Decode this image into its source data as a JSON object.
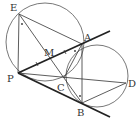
{
  "figure": {
    "type": "geometry-diagram",
    "points": [
      {
        "name": "E",
        "x": 19,
        "y": 14,
        "label_x": 10,
        "label_y": 11
      },
      {
        "name": "A",
        "x": 82,
        "y": 44,
        "label_x": 84,
        "label_y": 40
      },
      {
        "name": "M",
        "x": 49,
        "y": 59,
        "label_x": 45,
        "label_y": 55
      },
      {
        "name": "P",
        "x": 18,
        "y": 73,
        "label_x": 7,
        "label_y": 82
      },
      {
        "name": "C",
        "x": 64,
        "y": 78,
        "label_x": 57,
        "label_y": 92
      },
      {
        "name": "D",
        "x": 126,
        "y": 83,
        "label_x": 128,
        "label_y": 87
      },
      {
        "name": "B",
        "x": 82,
        "y": 103,
        "label_x": 77,
        "label_y": 115
      }
    ],
    "circles": [
      {
        "name": "circle-EAPC",
        "cx": 45,
        "cy": 42,
        "r": 39
      },
      {
        "name": "circle-ACBD",
        "cx": 97,
        "cy": 76,
        "r": 31
      }
    ],
    "segments": [
      {
        "name": "EP",
        "from": "E",
        "to": "P"
      },
      {
        "name": "EA",
        "from": "E",
        "to": "A"
      },
      {
        "name": "EC",
        "from": "E",
        "to": "C"
      },
      {
        "name": "PD",
        "from": "P",
        "to": "D"
      },
      {
        "name": "AB",
        "from": "A",
        "to": "B"
      },
      {
        "name": "AC",
        "from": "A",
        "to": "C"
      },
      {
        "name": "CB",
        "from": "C",
        "to": "B"
      },
      {
        "name": "BD",
        "from": "B",
        "to": "D"
      }
    ],
    "tangent_lines": [
      {
        "name": "PA-tangent",
        "from": "P",
        "through": "A",
        "end_x": 110,
        "end_y": 31
      },
      {
        "name": "PB-tangent",
        "from": "P",
        "through": "B",
        "end_x": 110,
        "end_y": 117
      }
    ],
    "labels": {
      "E": "E",
      "A": "A",
      "M": "M",
      "P": "P",
      "C": "C",
      "D": "D",
      "B": "B"
    }
  }
}
